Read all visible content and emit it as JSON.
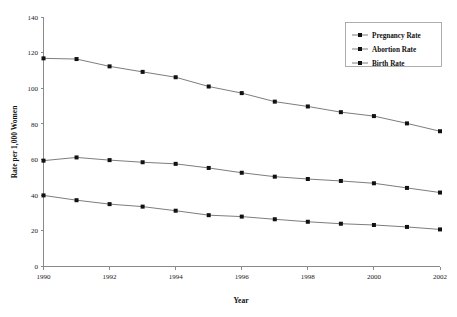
{
  "chart_data": {
    "type": "line",
    "title": "",
    "xlabel": "Year",
    "ylabel": "Rate per 1,000 Women",
    "x": [
      1990,
      1991,
      1992,
      1993,
      1994,
      1995,
      1996,
      1997,
      1998,
      1999,
      2000,
      2001,
      2002
    ],
    "xlim": [
      1990,
      2002
    ],
    "ylim": [
      0,
      140
    ],
    "ytick_labels": [
      "0",
      "20",
      "40",
      "60",
      "80",
      "100",
      "120",
      "140"
    ],
    "yticks": [
      0,
      20,
      40,
      60,
      80,
      100,
      120,
      140
    ],
    "xtick_labels": [
      "1990",
      "1992",
      "1994",
      "1996",
      "1998",
      "2000",
      "2002"
    ],
    "xticks": [
      1990,
      1992,
      1994,
      1996,
      1998,
      2000,
      2002
    ],
    "grid": false,
    "legend_position": "top-right",
    "marker": "square",
    "line_color": "#6e6e6e",
    "marker_color": "#111111",
    "series": [
      {
        "name": "Pregnancy Rate",
        "values": [
          116.8,
          116.4,
          112.3,
          109.2,
          106.2,
          101.0,
          97.3,
          92.5,
          89.8,
          86.6,
          84.4,
          80.3,
          75.9
        ]
      },
      {
        "name": "Abortion Rate",
        "values": [
          59.4,
          61.2,
          59.7,
          58.5,
          57.6,
          55.3,
          52.6,
          50.4,
          49.1,
          48.0,
          46.7,
          44.1,
          41.5
        ]
      },
      {
        "name": "Birth Rate",
        "values": [
          39.9,
          37.2,
          35.0,
          33.6,
          31.3,
          28.8,
          28.0,
          26.5,
          25.1,
          24.0,
          23.3,
          22.2,
          20.8
        ]
      }
    ]
  },
  "legend": {
    "entries": [
      {
        "label": "Pregnancy Rate"
      },
      {
        "label": "Abortion Rate"
      },
      {
        "label": "Birth Rate"
      }
    ]
  }
}
